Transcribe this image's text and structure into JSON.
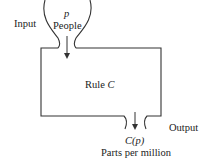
{
  "diagram": {
    "input_label": "Input",
    "input_variable": "p",
    "input_unit": "People",
    "rule_label_prefix": "Rule ",
    "rule_name": "C",
    "output_label": "Output",
    "output_function": "C(p)",
    "output_unit": "Parts per million",
    "colors": {
      "line": "#333333",
      "text": "#222222",
      "background": "#ffffff"
    }
  }
}
